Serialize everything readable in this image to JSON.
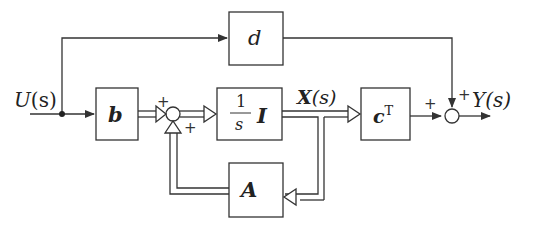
{
  "diagram": {
    "type": "state-space block diagram",
    "colors": {
      "stroke": "#333333",
      "background": "#ffffff"
    },
    "signals": {
      "input": {
        "name": "U",
        "arg": "(s)"
      },
      "state": {
        "name": "X",
        "arg": "(s)"
      },
      "output": {
        "name": "Y",
        "arg": "(s)"
      }
    },
    "blocks": {
      "d": {
        "label": "d"
      },
      "b": {
        "label": "b"
      },
      "integrator": {
        "numerator": "1",
        "denominator": "s",
        "matrix": "I"
      },
      "c": {
        "label": "c",
        "superscript": "T"
      },
      "A": {
        "label": "A"
      }
    },
    "summing_junctions": {
      "sum1": {
        "sign_top": "+",
        "sign_bottom": "+"
      },
      "sum2": {
        "sign_left": "+",
        "sign_top": "+"
      }
    }
  }
}
